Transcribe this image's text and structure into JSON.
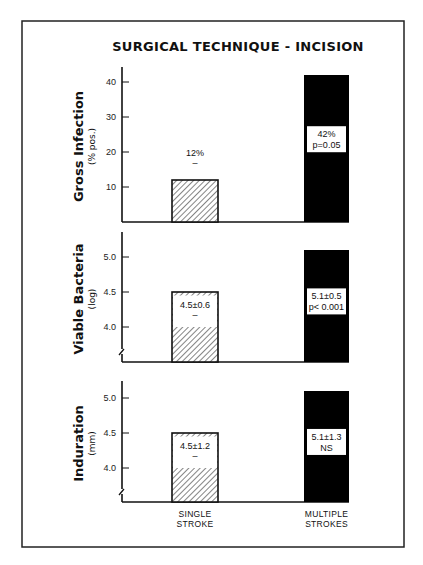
{
  "chart_data": {
    "type": "bar",
    "title": "SURGICAL TECHNIQUE - INCISION",
    "categories": [
      "SINGLE STROKE",
      "MULTIPLE STROKES"
    ],
    "category_lines": [
      [
        "SINGLE",
        "STROKE"
      ],
      [
        "MULTIPLE",
        "STROKES"
      ]
    ],
    "colors": {
      "single": "hatched",
      "multiple": "#000000",
      "frame": "#222222"
    },
    "panels": [
      {
        "id": "gross-infection",
        "ylabel": "Gross Infection",
        "ysub": "(% pos.)",
        "ylim": [
          0,
          45
        ],
        "yticks": [
          10,
          20,
          30,
          40
        ],
        "tick_labels": [
          "10",
          "20",
          "30",
          "40"
        ],
        "axis_break": false,
        "values": [
          12,
          42
        ],
        "annotations": [
          [
            "12%",
            "–"
          ],
          [
            "42%",
            "p=0.05"
          ]
        ],
        "single_white_band": null
      },
      {
        "id": "viable-bacteria",
        "ylabel": "Viable Bacteria",
        "ysub": "(log)",
        "ylim": [
          3.5,
          5.3
        ],
        "yticks": [
          4.0,
          4.5,
          5.0
        ],
        "tick_labels": [
          "4.0",
          "4.5",
          "5.0"
        ],
        "axis_break": true,
        "values": [
          4.5,
          5.1
        ],
        "annotations": [
          [
            "4.5±0.6",
            "–"
          ],
          [
            "5.1±0.5",
            "p< 0.001"
          ]
        ],
        "single_white_band": [
          4.0,
          4.45
        ]
      },
      {
        "id": "induration",
        "ylabel": "Induration",
        "ysub": "(mm)",
        "ylim": [
          3.5,
          5.3
        ],
        "yticks": [
          4.0,
          4.5,
          5.0
        ],
        "tick_labels": [
          "4.0",
          "4.5",
          "5.0"
        ],
        "axis_break": true,
        "values": [
          4.5,
          5.1
        ],
        "annotations": [
          [
            "4.5±1.2",
            "–"
          ],
          [
            "5.1±1.3",
            "NS"
          ]
        ],
        "single_white_band": [
          4.0,
          4.45
        ]
      }
    ]
  }
}
